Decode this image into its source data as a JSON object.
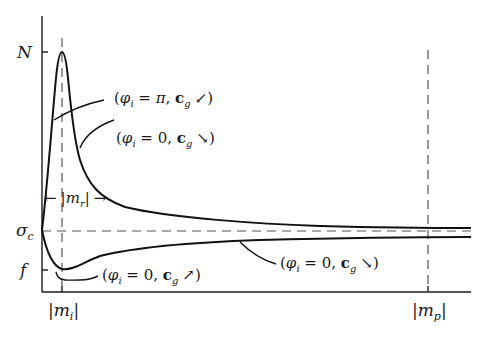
{
  "figure": {
    "type": "schematic-curve-diagram",
    "y_axis": {
      "ticks": [
        {
          "label": "N",
          "y": 52
        },
        {
          "label": "σ",
          "sub": "c",
          "y": 230
        },
        {
          "label": "f",
          "y": 270
        }
      ]
    },
    "x_axis": {
      "ticks": [
        {
          "label_left": "|",
          "label": "m",
          "sub": "i",
          "label_right": "|",
          "x": 62
        },
        {
          "label_left": "|",
          "label": "m",
          "sub": "p",
          "label_right": "|",
          "x": 428
        }
      ]
    },
    "reference_lines": {
      "horizontal_sigma_c": "dashed",
      "vertical_m_i": "dashed",
      "vertical_m_p": "dashed"
    },
    "range_annotation": {
      "left_arrow": "←",
      "text_prefix": "|",
      "var": "m",
      "sub": "r",
      "text_suffix": "|",
      "right_arrow": "→"
    },
    "curve_labels": [
      {
        "id": "phi-pi-cg-sw",
        "open": "(",
        "phi": "φ",
        "phi_sub": "i",
        "eq": " = ",
        "value": "π",
        "sep": ", ",
        "c": "c",
        "c_sub": "g",
        "arrow": "↙",
        "close": ")"
      },
      {
        "id": "phi-0-cg-se-upper",
        "open": "(",
        "phi": "φ",
        "phi_sub": "i",
        "eq": " = ",
        "value": "0",
        "sep": ", ",
        "c": "c",
        "c_sub": "g",
        "arrow": "↘",
        "close": ")"
      },
      {
        "id": "phi-0-cg-ne",
        "open": "(",
        "phi": "φ",
        "phi_sub": "i",
        "eq": " = ",
        "value": "0",
        "sep": ", ",
        "c": "c",
        "c_sub": "g",
        "arrow": "↗",
        "close": ")"
      },
      {
        "id": "phi-0-cg-se-lower",
        "open": "(",
        "phi": "φ",
        "phi_sub": "i",
        "eq": " = ",
        "value": "0",
        "sep": ", ",
        "c": "c",
        "c_sub": "g",
        "arrow": "↘",
        "close": ")"
      }
    ]
  }
}
